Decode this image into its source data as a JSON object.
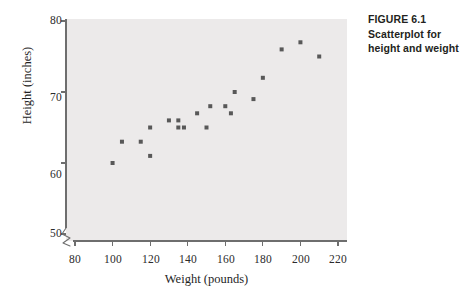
{
  "figure": {
    "caption_lines": [
      "FIGURE 6.1",
      "Scatterplot for",
      "height and weight"
    ],
    "caption_line_1": "FIGURE 6.1",
    "caption_line_2": "Scatterplot for",
    "caption_line_3": "height and weight"
  },
  "colors": {
    "panel_background": "#eceaea",
    "marker": "#585858",
    "axis": "#6e6e6e",
    "tick_text": "#2b2b2b",
    "caption_text": "#231f20",
    "page_background": "#ffffff"
  },
  "chart_data": {
    "type": "scatter",
    "title": "",
    "xlabel": "Weight (pounds)",
    "ylabel": "Height (inches)",
    "xlim": [
      72,
      222
    ],
    "ylim": [
      48.5,
      80.5
    ],
    "xticks": [
      80,
      100,
      120,
      140,
      160,
      180,
      200,
      220
    ],
    "xtick_labels": [
      "80",
      "100",
      "120",
      "140",
      "160",
      "180",
      "200",
      "220"
    ],
    "yticks": [
      50,
      60,
      70,
      80
    ],
    "ytick_labels": [
      "50",
      "60",
      "70",
      "80"
    ],
    "grid": false,
    "legend": false,
    "axis_break": {
      "present": true,
      "location": "lower-left",
      "note": "y-axis broken below 50"
    },
    "marker": {
      "shape": "square",
      "size_px": 4,
      "color": "#585858"
    },
    "n_points": 20,
    "x": [
      100,
      105,
      115,
      120,
      120,
      130,
      135,
      135,
      138,
      145,
      150,
      152,
      160,
      163,
      165,
      175,
      180,
      190,
      200,
      210
    ],
    "y": [
      60,
      63,
      63,
      65,
      61,
      66,
      66,
      65,
      65,
      67,
      65,
      68,
      68,
      67,
      70,
      69,
      72,
      76,
      77,
      75
    ],
    "points": [
      {
        "weight": 100,
        "height": 60
      },
      {
        "weight": 105,
        "height": 63
      },
      {
        "weight": 115,
        "height": 63
      },
      {
        "weight": 120,
        "height": 65
      },
      {
        "weight": 120,
        "height": 61
      },
      {
        "weight": 130,
        "height": 66
      },
      {
        "weight": 135,
        "height": 66
      },
      {
        "weight": 135,
        "height": 65
      },
      {
        "weight": 138,
        "height": 65
      },
      {
        "weight": 145,
        "height": 67
      },
      {
        "weight": 150,
        "height": 65
      },
      {
        "weight": 152,
        "height": 68
      },
      {
        "weight": 160,
        "height": 68
      },
      {
        "weight": 163,
        "height": 67
      },
      {
        "weight": 165,
        "height": 70
      },
      {
        "weight": 175,
        "height": 69
      },
      {
        "weight": 180,
        "height": 72
      },
      {
        "weight": 190,
        "height": 76
      },
      {
        "weight": 200,
        "height": 77
      },
      {
        "weight": 210,
        "height": 75
      }
    ]
  }
}
